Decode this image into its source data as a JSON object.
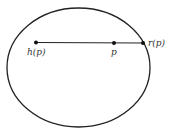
{
  "diagram": {
    "ellipse": {
      "cx": 78.5,
      "cy": 67.5,
      "rx": 71.5,
      "ry": 59.5,
      "stroke": "#222222"
    },
    "segment": {
      "x1": 36,
      "y1": 42.5,
      "x2": 143,
      "y2": 43,
      "stroke": "#222222"
    },
    "points": [
      {
        "id": "h",
        "x": 36,
        "y": 42.5,
        "label": "h(p)",
        "lx": 27,
        "ly": 55
      },
      {
        "id": "p",
        "x": 114,
        "y": 43,
        "label": "p",
        "lx": 111,
        "ly": 55
      },
      {
        "id": "r",
        "x": 143,
        "y": 43,
        "label": "r(p)",
        "lx": 148,
        "ly": 46
      }
    ]
  }
}
